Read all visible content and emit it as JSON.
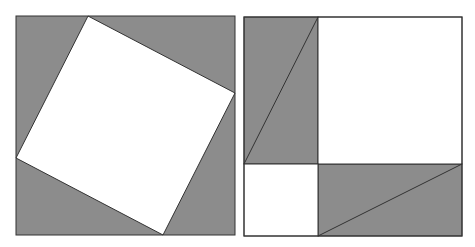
{
  "diagram": {
    "colors": {
      "background": "#ffffff",
      "shaded": "#8c8c8c",
      "unshaded": "#ffffff",
      "stroke": "#333333"
    },
    "left_figure": {
      "outer_square": {
        "x": 16,
        "y": 16,
        "w": 219,
        "h": 219
      },
      "inner_tilted_square": [
        [
          88,
          16
        ],
        [
          235,
          93
        ],
        [
          163,
          235
        ],
        [
          16,
          158
        ]
      ],
      "triangles": [
        [
          [
            16,
            16
          ],
          [
            88,
            16
          ],
          [
            16,
            158
          ]
        ],
        [
          [
            88,
            16
          ],
          [
            235,
            16
          ],
          [
            235,
            93
          ]
        ],
        [
          [
            235,
            93
          ],
          [
            235,
            235
          ],
          [
            163,
            235
          ]
        ],
        [
          [
            163,
            235
          ],
          [
            16,
            235
          ],
          [
            16,
            158
          ]
        ]
      ]
    },
    "right_figure": {
      "outer_square": {
        "x": 244,
        "y": 17,
        "w": 218,
        "h": 219
      },
      "divider_x": 318,
      "divider_y": 164,
      "large_square": {
        "x": 318,
        "y": 17,
        "w": 144,
        "h": 147
      },
      "small_square": {
        "x": 244,
        "y": 164,
        "w": 74,
        "h": 72
      },
      "rect_top_left": {
        "x": 244,
        "y": 17,
        "w": 74,
        "h": 147
      },
      "rect_bottom_right": {
        "x": 318,
        "y": 164,
        "w": 144,
        "h": 72
      },
      "diagonal_top_left": [
        [
          244,
          164
        ],
        [
          318,
          17
        ]
      ],
      "diagonal_bottom_right": [
        [
          318,
          236
        ],
        [
          462,
          164
        ]
      ]
    }
  }
}
